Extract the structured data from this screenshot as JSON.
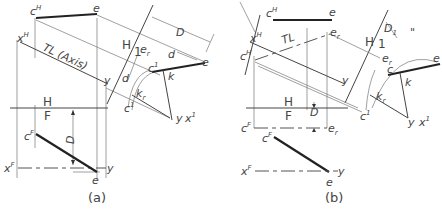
{
  "figure": {
    "panels": [
      {
        "id": "a",
        "caption": "(a)",
        "labels": {
          "cH": "c",
          "cH_sup": "H",
          "eH": "e",
          "xH": "x",
          "xH_sup": "H",
          "TL": "TL (Axis)",
          "y_top": "y",
          "H_plane": "H",
          "F_plane": "F",
          "H1_H": "H",
          "H1_1": "1",
          "D_dim": "D",
          "d_dim1": "d",
          "d_dim2": "d",
          "er": "e",
          "er_sub": "r",
          "c1": "c",
          "c1_sup": "1",
          "e1": "e",
          "k": "k",
          "kr": "k",
          "kr_sub": "r",
          "cr1": "c",
          "cr1_sup": "1",
          "cr1_sub": "r",
          "y_aux": "y",
          "x1": "x",
          "x1_sup": "1",
          "cF": "c",
          "cF_sup": "F",
          "D_front": "D",
          "xF": "x",
          "xF_sup": "F",
          "y_front": "y",
          "eF": "e"
        }
      },
      {
        "id": "b",
        "caption": "(b)",
        "labels": {
          "cH": "c",
          "cH_sup": "H",
          "eH": "e",
          "xH": "x",
          "xH_sup": "H",
          "crH": "c",
          "crH_sup": "H",
          "crH_sub": "r",
          "TL": "TL",
          "er": "e",
          "er_sub": "r",
          "y_top": "y",
          "H1_H": "H",
          "H1_1": "1",
          "D1_dim": "D",
          "D1_sub": "1",
          "quote": "\"",
          "er1": "e",
          "er1_sub": "r",
          "er1_sup": "1",
          "c1": "c",
          "c1_sup": "1",
          "e1": "e",
          "k": "k",
          "kr": "k",
          "kr_sub": "r",
          "cr1": "c",
          "cr1_sup": "1",
          "cr1_sub": "r",
          "y_aux": "y",
          "x1": "x",
          "x1_sup": "1",
          "H_plane": "H",
          "F_plane": "F",
          "D1_front": "D",
          "crF": "c",
          "crF_sup": "F",
          "crF_sub": "r",
          "erF": "e",
          "erF_sub": "r",
          "cF": "c",
          "cF_sup": "F",
          "xF": "x",
          "xF_sup": "F",
          "y_front": "y",
          "eF": "e"
        }
      }
    ]
  }
}
